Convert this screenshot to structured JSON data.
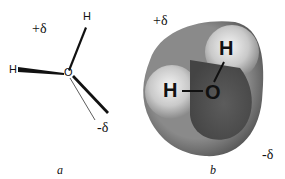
{
  "figure": {
    "panel_a": {
      "caption": "a",
      "charge_positive": "+δ",
      "charge_negative": "-δ",
      "atoms": {
        "h_top": "H",
        "h_left": "H",
        "oxygen": "O"
      }
    },
    "panel_b": {
      "caption": "b",
      "charge_positive": "+δ",
      "charge_negative": "-δ",
      "atoms": {
        "h_top": "H",
        "h_left": "H",
        "oxygen": "O"
      }
    }
  }
}
